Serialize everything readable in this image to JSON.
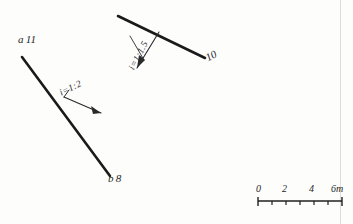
{
  "drawing": {
    "title": "slope-line-diagram",
    "background_color": "#fdfdfc",
    "ink_color": "#1a1a1a",
    "points": [
      {
        "name": "a",
        "elevation": "11"
      },
      {
        "name": "b",
        "elevation": "8"
      }
    ],
    "labels": {
      "point_a_name": "a",
      "point_a_elev": "11",
      "point_b_name": "b",
      "point_b_elev": "8",
      "elevation_10": "10",
      "slope_left": "i=1:2",
      "slope_right": "i=1:1.5"
    },
    "lines": [
      {
        "name": "line-ab",
        "from": "a",
        "to": "b",
        "slope": "i=1:2",
        "x1": 22,
        "y1": 57,
        "x2": 110,
        "y2": 176
      },
      {
        "name": "line-10",
        "slope": "i=1:1.5",
        "elevation": "10",
        "x1": 118,
        "y1": 16,
        "x2": 205,
        "y2": 58
      }
    ],
    "leaders": [
      {
        "name": "slope-leader-left",
        "x1": 99,
        "y1": 112,
        "x2": 62,
        "y2": 96
      },
      {
        "name": "slope-leader-right",
        "x1": 136,
        "y1": 66,
        "x2": 158,
        "y2": 33
      }
    ]
  },
  "scalebar": {
    "units": "m",
    "ticks": [
      "0",
      "2",
      "4",
      "6m"
    ],
    "tick_values": [
      0,
      2,
      4,
      6
    ],
    "minor_divisions": 6,
    "length_px": 84
  }
}
